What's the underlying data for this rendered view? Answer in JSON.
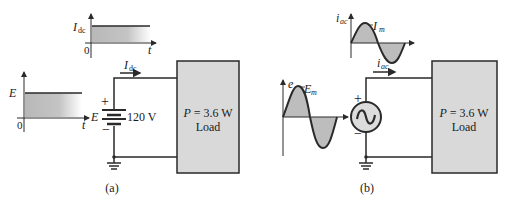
{
  "figure_a": {
    "caption": "(a)",
    "source_waveform": {
      "y_label": "E",
      "origin": "0",
      "x_label": "t"
    },
    "current_waveform": {
      "y_label_main": "I",
      "y_label_sub": "dc",
      "origin": "0",
      "x_label": "t"
    },
    "current_arrow": {
      "main": "I",
      "sub": "dc"
    },
    "battery": {
      "symbol_label": "E",
      "plus": "+",
      "minus": "−",
      "value": "120 V"
    },
    "load": {
      "power_main": "P",
      "power_value": " = 3.6 W",
      "label": "Load"
    }
  },
  "figure_b": {
    "caption": "(b)",
    "source_waveform": {
      "y_label": "e",
      "peak_main": "E",
      "peak_sub": "m"
    },
    "current_waveform": {
      "y_label_main": "i",
      "y_label_sub": "ac",
      "peak_main": "I",
      "peak_sub": "m"
    },
    "current_arrow": {
      "main": "i",
      "sub": "ac"
    },
    "source": {
      "plus": "+",
      "minus": "−"
    },
    "load": {
      "power_main": "P",
      "power_value": " = 3.6 W",
      "label": "Load"
    }
  },
  "colors": {
    "line": "#2a2a2a",
    "fill_gray": "#bdbdbd",
    "load_fill": "#d9d9d9",
    "source_fill": "#dcdcdc"
  }
}
